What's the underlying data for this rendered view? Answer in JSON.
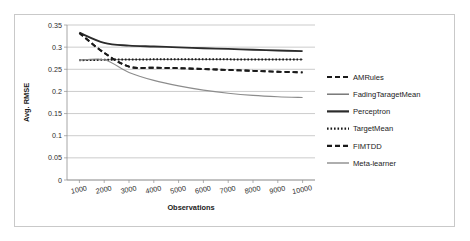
{
  "chart_data": {
    "type": "line",
    "title": "",
    "xlabel": "Observations",
    "ylabel": "Avg. RMSE",
    "xlim": [
      500,
      10500
    ],
    "ylim": [
      0,
      0.35
    ],
    "grid": true,
    "legend_position": "right",
    "x": [
      1000,
      2000,
      3000,
      4000,
      5000,
      6000,
      7000,
      8000,
      9000,
      10000
    ],
    "xticks": [
      "1000",
      "2000",
      "3000",
      "4000",
      "5000",
      "6000",
      "7000",
      "8000",
      "9000",
      "10000"
    ],
    "yticks": [
      "0",
      "0.05",
      "0.1",
      "0.15",
      "0.2",
      "0.25",
      "0.3",
      "0.35"
    ],
    "series": [
      {
        "name": "AMRules",
        "style": "dashed",
        "color": "#1a1a1a",
        "width": 1.9,
        "dash": "5,3",
        "values": [
          0.332,
          0.287,
          0.256,
          0.2535,
          0.2525,
          0.2505,
          0.2485,
          0.2465,
          0.2445,
          0.243
        ]
      },
      {
        "name": "FadingTaragetMean",
        "style": "solid",
        "color": "#6e6e6e",
        "width": 1.0,
        "dash": "",
        "values": [
          0.271,
          0.2715,
          0.272,
          0.2722,
          0.2722,
          0.2722,
          0.2722,
          0.2722,
          0.2722,
          0.2722
        ]
      },
      {
        "name": "Perceptron",
        "style": "solid",
        "color": "#2b2b2b",
        "width": 1.9,
        "dash": "",
        "values": [
          0.3325,
          0.3095,
          0.3035,
          0.3015,
          0.2995,
          0.2975,
          0.296,
          0.294,
          0.2925,
          0.291
        ]
      },
      {
        "name": "TargetMean",
        "style": "dotted",
        "color": "#1a1a1a",
        "width": 2.0,
        "dash": "1.6,1.9",
        "values": [
          0.2705,
          0.2715,
          0.2722,
          0.2724,
          0.2724,
          0.2724,
          0.2724,
          0.2722,
          0.2722,
          0.272
        ]
      },
      {
        "name": "FIMTDD",
        "style": "dashed",
        "color": "#1a1a1a",
        "width": 1.9,
        "dash": "5,3",
        "values": [
          0.332,
          0.287,
          0.256,
          0.2535,
          0.2525,
          0.2505,
          0.2485,
          0.2465,
          0.2445,
          0.243
        ]
      },
      {
        "name": "Meta-learner",
        "style": "solid",
        "color": "#8c8c8c",
        "width": 1.1,
        "dash": "",
        "values": [
          0.2705,
          0.2715,
          0.243,
          0.225,
          0.2125,
          0.203,
          0.196,
          0.191,
          0.188,
          0.1862
        ]
      }
    ],
    "legend": [
      {
        "label": "AMRules",
        "style": "dashed",
        "color": "#1a1a1a",
        "width": 2.2,
        "dash": "5,3"
      },
      {
        "label": "FadingTaragetMean",
        "style": "solid",
        "color": "#6e6e6e",
        "width": 1.4,
        "dash": ""
      },
      {
        "label": "Perceptron",
        "style": "solid",
        "color": "#2b2b2b",
        "width": 2.2,
        "dash": ""
      },
      {
        "label": "TargetMean",
        "style": "dotted",
        "color": "#1a1a1a",
        "width": 2.2,
        "dash": "1.6,1.9"
      },
      {
        "label": "FIMTDD",
        "style": "dashed",
        "color": "#1a1a1a",
        "width": 2.2,
        "dash": "5,3"
      },
      {
        "label": "Meta-learner",
        "style": "solid",
        "color": "#8c8c8c",
        "width": 1.4,
        "dash": ""
      }
    ]
  },
  "colors": {
    "frame_border": "#c9c9c9",
    "gridline": "#b5b5b5",
    "axis": "#8f8f8f",
    "background": "#ffffff",
    "text": "#1a1a1a"
  }
}
